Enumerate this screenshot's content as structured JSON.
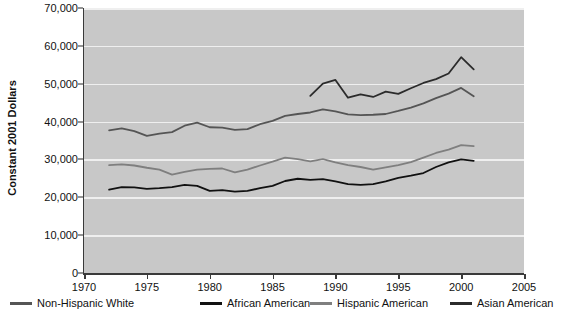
{
  "chart_data": {
    "type": "line",
    "title": "",
    "xlabel": "",
    "ylabel": "Constant 2001 Dollars",
    "xlim": [
      1970,
      2005
    ],
    "ylim": [
      0,
      70000
    ],
    "grid": true,
    "legend_position": "bottom",
    "xticks": [
      "1970",
      "1975",
      "1980",
      "1985",
      "1990",
      "1995",
      "2000",
      "2005"
    ],
    "xtick_values": [
      1970,
      1975,
      1980,
      1985,
      1990,
      1995,
      2000,
      2005
    ],
    "yticks": [
      "0",
      "10,000",
      "20,000",
      "30,000",
      "40,000",
      "50,000",
      "60,000",
      "70,000"
    ],
    "ytick_values": [
      0,
      10000,
      20000,
      30000,
      40000,
      50000,
      60000,
      70000
    ],
    "series": [
      {
        "name": "Non-Hispanic White",
        "color": "#555555",
        "x": [
          1972,
          1973,
          1974,
          1975,
          1976,
          1977,
          1978,
          1979,
          1980,
          1981,
          1982,
          1983,
          1984,
          1985,
          1986,
          1987,
          1988,
          1989,
          1990,
          1991,
          1992,
          1993,
          1994,
          1995,
          1996,
          1997,
          1998,
          1999,
          2000,
          2001
        ],
        "values": [
          37700,
          38200,
          37500,
          36200,
          36800,
          37200,
          38900,
          39700,
          38500,
          38400,
          37800,
          38000,
          39300,
          40200,
          41500,
          42000,
          42400,
          43200,
          42700,
          41900,
          41700,
          41800,
          42000,
          42800,
          43700,
          44800,
          46200,
          47400,
          48900,
          46700
        ]
      },
      {
        "name": "African American",
        "color": "#111111",
        "x": [
          1972,
          1973,
          1974,
          1975,
          1976,
          1977,
          1978,
          1979,
          1980,
          1981,
          1982,
          1983,
          1984,
          1985,
          1986,
          1987,
          1988,
          1989,
          1990,
          1991,
          1992,
          1993,
          1994,
          1995,
          1996,
          1997,
          1998,
          1999,
          2000,
          2001
        ],
        "values": [
          22000,
          22700,
          22600,
          22200,
          22400,
          22700,
          23300,
          23000,
          21700,
          21900,
          21500,
          21700,
          22400,
          23000,
          24300,
          24900,
          24600,
          24800,
          24200,
          23500,
          23300,
          23500,
          24200,
          25100,
          25700,
          26400,
          28000,
          29200,
          30000,
          29600
        ]
      },
      {
        "name": "Hispanic American",
        "color": "#7f7f7f",
        "x": [
          1972,
          1973,
          1974,
          1975,
          1976,
          1977,
          1978,
          1979,
          1980,
          1981,
          1982,
          1983,
          1984,
          1985,
          1986,
          1987,
          1988,
          1989,
          1990,
          1991,
          1992,
          1993,
          1994,
          1995,
          1996,
          1997,
          1998,
          1999,
          2000,
          2001
        ],
        "values": [
          28500,
          28700,
          28400,
          27800,
          27300,
          26000,
          26700,
          27300,
          27500,
          27600,
          26600,
          27300,
          28400,
          29400,
          30500,
          30100,
          29500,
          30100,
          29200,
          28500,
          28000,
          27300,
          27900,
          28500,
          29300,
          30500,
          31700,
          32600,
          33800,
          33500
        ]
      },
      {
        "name": "Asian American",
        "color": "#2b2b2b",
        "x": [
          1988,
          1989,
          1990,
          1991,
          1992,
          1993,
          1994,
          1995,
          1996,
          1997,
          1998,
          1999,
          2000,
          2001
        ],
        "values": [
          46800,
          50000,
          51000,
          46300,
          47200,
          46500,
          47900,
          47300,
          48800,
          50200,
          51200,
          52700,
          57000,
          53800
        ]
      }
    ]
  },
  "legend": {
    "items": [
      {
        "label": "Non-Hispanic White",
        "color": "#555555"
      },
      {
        "label": "African American",
        "color": "#111111"
      },
      {
        "label": "Hispanic American",
        "color": "#7f7f7f"
      },
      {
        "label": "Asian American",
        "color": "#2b2b2b"
      }
    ]
  }
}
